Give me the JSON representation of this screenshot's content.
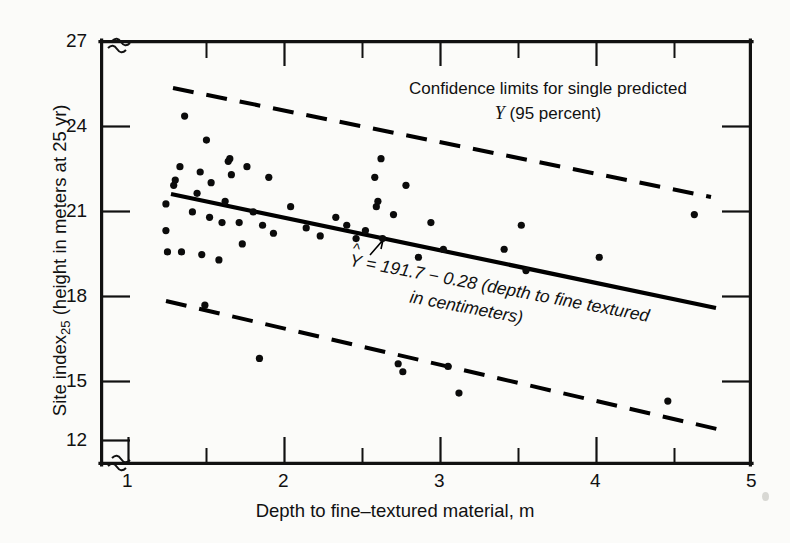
{
  "chart_data": {
    "type": "scatter",
    "title": "",
    "xlabel": "Depth to fine–textured material, m",
    "ylabel": "Site index₂₅ (height in meters at 25 yr)",
    "ylabel_main": "Site index",
    "ylabel_sub": "25",
    "ylabel_rest": " (height in meters at 25 yr)",
    "xlim": [
      1,
      5
    ],
    "ylim": [
      12,
      27
    ],
    "axis_break_x": true,
    "axis_break_y": true,
    "grid": false,
    "xticks": [
      1,
      2,
      3,
      4,
      5
    ],
    "xtick_labels": [
      "1",
      "2",
      "3",
      "4",
      "5"
    ],
    "xticks_minor": [
      1.5,
      2.5,
      3.5,
      4.5
    ],
    "yticks": [
      12,
      15,
      18,
      21,
      24,
      27
    ],
    "ytick_labels": [
      "12",
      "15",
      "18",
      "21",
      "24",
      "27"
    ],
    "legend_position": "none",
    "annotations": [
      {
        "name": "confidence-limits-note",
        "line1": "Confidence limits for single predicted",
        "line2_symbol": "Y",
        "line2_rest": " (95 percent)"
      },
      {
        "name": "regression-equation",
        "symbol": "Y",
        "line1": "= 191.7 − 0.28 (depth to fine textured",
        "line2": "in centimeters)"
      }
    ],
    "series": [
      {
        "name": "Regression line (fitted)",
        "type": "line",
        "style": "solid",
        "color": "#000000",
        "equation": "Y-hat = 191.7 - 0.28 (depth to fine textured in centimeters)",
        "intercept_display": 191.7,
        "slope_display": -0.28,
        "x": [
          1.28,
          4.77
        ],
        "y": [
          21.15,
          16.63
        ]
      },
      {
        "name": "Upper 95% confidence limit for single predicted Y",
        "type": "line",
        "style": "dashed",
        "color": "#000000",
        "x": [
          1.19,
          4.73
        ],
        "y": [
          25.1,
          20.67
        ]
      },
      {
        "name": "Lower 95% confidence limit for single predicted Y",
        "type": "line",
        "style": "dashed",
        "color": "#000000",
        "x": [
          1.17,
          4.97
        ],
        "y": [
          16.88,
          12.0
        ]
      },
      {
        "name": "Site index observations",
        "type": "scatter",
        "color": "#0b0b0b",
        "marker": "filled-circle",
        "n": 57,
        "points": [
          [
            1.24,
            20.9
          ],
          [
            1.24,
            19.9
          ],
          [
            1.25,
            19.1
          ],
          [
            1.29,
            21.6
          ],
          [
            1.3,
            21.8
          ],
          [
            1.33,
            22.3
          ],
          [
            1.34,
            19.1
          ],
          [
            1.36,
            24.2
          ],
          [
            1.41,
            20.6
          ],
          [
            1.44,
            21.3
          ],
          [
            1.46,
            22.1
          ],
          [
            1.47,
            19.0
          ],
          [
            1.49,
            17.1
          ],
          [
            1.5,
            23.3
          ],
          [
            1.52,
            20.4
          ],
          [
            1.53,
            21.7
          ],
          [
            1.58,
            18.8
          ],
          [
            1.6,
            20.2
          ],
          [
            1.62,
            21.0
          ],
          [
            1.64,
            22.5
          ],
          [
            1.65,
            22.6
          ],
          [
            1.66,
            22.0
          ],
          [
            1.71,
            20.2
          ],
          [
            1.73,
            19.4
          ],
          [
            1.76,
            22.3
          ],
          [
            1.8,
            20.6
          ],
          [
            1.84,
            15.1
          ],
          [
            1.86,
            20.1
          ],
          [
            1.9,
            21.9
          ],
          [
            1.93,
            19.8
          ],
          [
            2.04,
            20.8
          ],
          [
            2.14,
            20.0
          ],
          [
            2.23,
            19.7
          ],
          [
            2.33,
            20.4
          ],
          [
            2.4,
            20.1
          ],
          [
            2.46,
            19.6
          ],
          [
            2.52,
            19.9
          ],
          [
            2.58,
            21.9
          ],
          [
            2.59,
            20.8
          ],
          [
            2.6,
            21.0
          ],
          [
            2.62,
            22.6
          ],
          [
            2.63,
            19.6
          ],
          [
            2.7,
            20.5
          ],
          [
            2.73,
            14.9
          ],
          [
            2.76,
            14.6
          ],
          [
            2.78,
            21.6
          ],
          [
            2.86,
            18.9
          ],
          [
            2.94,
            20.2
          ],
          [
            3.02,
            19.2
          ],
          [
            3.05,
            14.8
          ],
          [
            3.12,
            13.8
          ],
          [
            3.41,
            19.2
          ],
          [
            3.52,
            20.1
          ],
          [
            3.55,
            18.4
          ],
          [
            4.02,
            18.9
          ],
          [
            4.46,
            13.5
          ],
          [
            4.63,
            20.5
          ]
        ]
      }
    ]
  }
}
